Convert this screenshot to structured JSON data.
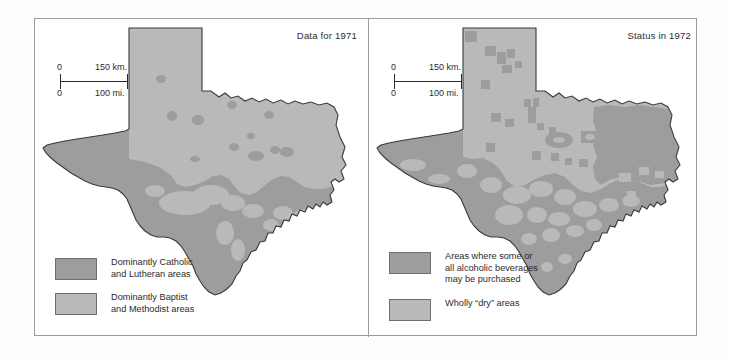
{
  "figure": {
    "type": "thematic-map-pair",
    "region": "Texas",
    "background_color": "#ffffff",
    "frame_color": "#9b9b9b"
  },
  "colors": {
    "dark_shade": "#9d9d9d",
    "light_shade": "#b9b9b9",
    "outline": "#3a3a3a",
    "text": "#2b2b2b"
  },
  "scale_bar": {
    "zero_top": "0",
    "km_label": "150 km.",
    "zero_bottom": "0",
    "mi_label": "100 mi."
  },
  "panels": [
    {
      "id": "left",
      "title": "Data for 1971",
      "legend": [
        {
          "swatch": "dark",
          "color": "#9d9d9d",
          "label": "Dominantly Catholic\nand Lutheran areas"
        },
        {
          "swatch": "light",
          "color": "#b9b9b9",
          "label": "Dominantly Baptist\nand Methodist areas"
        }
      ]
    },
    {
      "id": "right",
      "title": "Status in 1972",
      "legend": [
        {
          "swatch": "dark",
          "color": "#9d9d9d",
          "label": "Areas where some or\nall alcoholic beverages\nmay be purchased"
        },
        {
          "swatch": "light",
          "color": "#b9b9b9",
          "label": "Wholly “dry” areas"
        }
      ]
    }
  ]
}
